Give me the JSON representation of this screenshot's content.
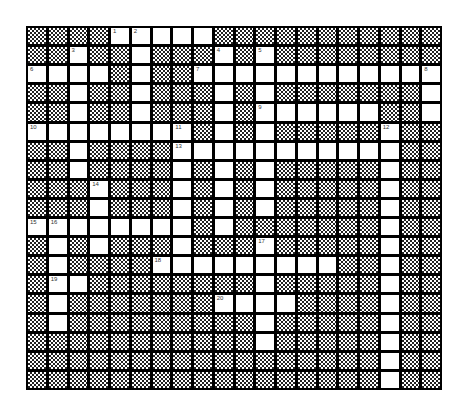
{
  "puzzle": {
    "type": "crossword",
    "columns": 20,
    "rows": 19,
    "colors": {
      "grid_line": "#000000",
      "open_cell": "#ffffff",
      "block_pattern": "#222222"
    },
    "layout": [
      "####WWWWW###########",
      "##W##W###W#W########",
      "WWWW#W##WWWWWWWWWWWW",
      "##W##W###W#W#######W",
      "##W##W###W#WWWWWW##W",
      "WWWWWWWW#W#W#####W##",
      "##W####WWWWWWWWWWW##",
      "##W####W#W#W#####W##",
      "###W###W#W#W#####W##",
      "###W###W#W#W#####W##",
      "WWWWWWWW#W#######W##",
      "#W#W###W###W#####W##",
      "#W####WWWWWWWWW##W##",
      "#WW########W#####W##",
      "#W#######WWWW####W##",
      "#W#########W#####W##",
      "###########W#####W##",
      "#################W##",
      "#################W##"
    ],
    "clue_numbers": [
      {
        "n": "1",
        "row": 0,
        "col": 4
      },
      {
        "n": "2",
        "row": 0,
        "col": 5
      },
      {
        "n": "3",
        "row": 1,
        "col": 2
      },
      {
        "n": "4",
        "row": 1,
        "col": 9
      },
      {
        "n": "5",
        "row": 1,
        "col": 11
      },
      {
        "n": "6",
        "row": 2,
        "col": 0
      },
      {
        "n": "7",
        "row": 2,
        "col": 8
      },
      {
        "n": "8",
        "row": 2,
        "col": 19
      },
      {
        "n": "9",
        "row": 4,
        "col": 11
      },
      {
        "n": "10",
        "row": 5,
        "col": 0
      },
      {
        "n": "11",
        "row": 5,
        "col": 7
      },
      {
        "n": "12",
        "row": 5,
        "col": 17
      },
      {
        "n": "13",
        "row": 6,
        "col": 7
      },
      {
        "n": "14",
        "row": 8,
        "col": 3
      },
      {
        "n": "15",
        "row": 10,
        "col": 0
      },
      {
        "n": "16",
        "row": 10,
        "col": 1
      },
      {
        "n": "17",
        "row": 11,
        "col": 11
      },
      {
        "n": "18",
        "row": 12,
        "col": 6
      },
      {
        "n": "19",
        "row": 13,
        "col": 1
      },
      {
        "n": "20",
        "row": 14,
        "col": 9
      }
    ]
  }
}
